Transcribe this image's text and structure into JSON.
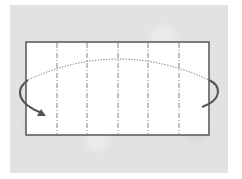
{
  "diagram": {
    "type": "origami-fold-step",
    "background_color": "#e2e2e2",
    "paper": {
      "x": 26,
      "y": 42,
      "width": 183,
      "height": 93,
      "fill": "#ffffff",
      "stroke": "#555555"
    },
    "fold_lines": [
      {
        "x": 57,
        "style": "dash-dot"
      },
      {
        "x": 87,
        "style": "dash-dot"
      },
      {
        "x": 118,
        "style": "dash-dot"
      },
      {
        "x": 148,
        "style": "dash-dot"
      },
      {
        "x": 179,
        "style": "dash-dot"
      }
    ],
    "arrow": {
      "kind": "turn-over",
      "hidden_path_style": "dotted",
      "visible_path_color": "#555555",
      "direction": "right-to-left over the top"
    }
  }
}
